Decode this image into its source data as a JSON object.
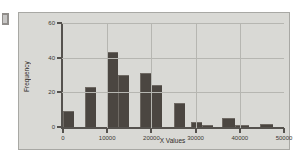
{
  "chart_data": {
    "type": "bar",
    "title": "",
    "xlabel": "X Values",
    "ylabel": "Frequency",
    "xlim": [
      0,
      50000
    ],
    "ylim": [
      0,
      60
    ],
    "bin_width": 2500,
    "grid": true,
    "legend": "none",
    "x_ticks": [
      "0",
      "10000",
      "20000",
      "30000",
      "40000",
      "50000"
    ],
    "x_tick_values": [
      0,
      10000,
      20000,
      30000,
      40000,
      50000
    ],
    "y_ticks": [
      "0",
      "20",
      "40",
      "60"
    ],
    "y_tick_values": [
      0,
      20,
      40,
      60
    ],
    "bin_starts": [
      0,
      2500,
      5000,
      7500,
      10000,
      12500,
      15000,
      17500,
      20000,
      22500,
      25000,
      27500,
      30000,
      32500,
      35000,
      37500,
      40000,
      42500,
      45000,
      47500
    ],
    "categories": [
      "0-2500",
      "2500-5000",
      "5000-7500",
      "7500-10000",
      "10000-12500",
      "12500-15000",
      "15000-17500",
      "17500-20000",
      "20000-22500",
      "22500-25000",
      "25000-27500",
      "27500-30000",
      "30000-32500",
      "32500-35000",
      "35000-37500",
      "37500-40000",
      "40000-42500",
      "42500-45000",
      "45000-47500",
      "47500-50000"
    ],
    "values": [
      9,
      0,
      23,
      0,
      43,
      0,
      30,
      0,
      31,
      0,
      24,
      0,
      14,
      0,
      3,
      0,
      1,
      5,
      1,
      2
    ],
    "bars": [
      {
        "start": 0,
        "end": 2500,
        "value": 9
      },
      {
        "start": 5000,
        "end": 7500,
        "value": 23
      },
      {
        "start": 10000,
        "end": 12500,
        "value": 43
      },
      {
        "start": 12500,
        "end": 15000,
        "value": 30
      },
      {
        "start": 17500,
        "end": 20000,
        "value": 31
      },
      {
        "start": 20000,
        "end": 22500,
        "value": 24
      },
      {
        "start": 25000,
        "end": 27500,
        "value": 14
      },
      {
        "start": 29000,
        "end": 31500,
        "value": 3
      },
      {
        "start": 31500,
        "end": 34000,
        "value": 1
      },
      {
        "start": 36000,
        "end": 39000,
        "value": 5
      },
      {
        "start": 39000,
        "end": 42000,
        "value": 1
      },
      {
        "start": 44500,
        "end": 47500,
        "value": 2
      }
    ],
    "colors": {
      "bar": "#4b4641",
      "bar_edge": "#6f6a64",
      "plot_background": "#d9d9d5",
      "grid": "#b6b6b1",
      "axis": "#55524e",
      "text": "#2e2b28"
    }
  }
}
